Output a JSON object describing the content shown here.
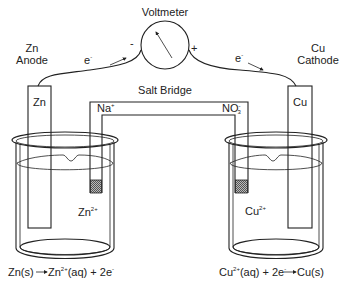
{
  "voltmeter": {
    "label": "Voltmeter",
    "negative": "-",
    "positive": "+"
  },
  "anode": {
    "line1": "Zn",
    "line2": "Anode",
    "electrode_label": "Zn",
    "ion": "Zn",
    "ion_charge": "2+"
  },
  "cathode": {
    "line1": "Cu",
    "line2": "Cathode",
    "electrode_label": "Cu",
    "ion": "Cu",
    "ion_charge": "2+"
  },
  "electron": {
    "symbol": "e",
    "charge": "-"
  },
  "salt_bridge": {
    "label": "Salt Bridge",
    "cation": "Na",
    "cation_charge": "+",
    "anion": "NO",
    "anion_sub": "3",
    "anion_charge": "-"
  },
  "equations": {
    "anode": {
      "left": "Zn(s)",
      "right_ion": "Zn",
      "right_charge": "2+",
      "right_rest": "(aq) + 2e",
      "e_charge": "-"
    },
    "cathode": {
      "left_ion": "Cu",
      "left_charge": "2+",
      "left_rest": "(aq) + 2e",
      "e_charge": "-",
      "right": "Cu(s)"
    }
  },
  "colors": {
    "line": "#222222",
    "background": "#ffffff",
    "plug": "#888888"
  }
}
